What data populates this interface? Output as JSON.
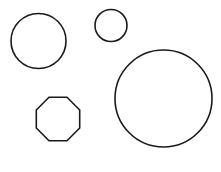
{
  "canvas": {
    "width": 221,
    "height": 172,
    "background_color": "#ffffff",
    "stroke_color": "#1a1a1a",
    "stroke_width": 1.6
  },
  "shapes": [
    {
      "name": "circle-large-left",
      "type": "circle",
      "cx": 38.5,
      "cy": 41,
      "r": 27.5,
      "fill": "none",
      "stroke": "#1a1a1a"
    },
    {
      "name": "circle-small-top",
      "type": "circle",
      "cx": 111,
      "cy": 25.5,
      "r": 16,
      "fill": "none",
      "stroke": "#1a1a1a"
    },
    {
      "name": "circle-largest-right",
      "type": "circle",
      "cx": 163.5,
      "cy": 98.5,
      "r": 48.5,
      "fill": "none",
      "stroke": "#1a1a1a"
    },
    {
      "name": "octagon-bottom-left",
      "type": "polygon",
      "sides": 8,
      "cx": 58,
      "cy": 128,
      "r": 33,
      "rotation_deg": 22.5,
      "points": "49.0,97.3 67.0,97.3 79.7,110.0 79.7,128.0 67.0,140.7 49.0,140.7 36.3,128.0 36.3,110.0",
      "fill": "none",
      "stroke": "#1a1a1a"
    }
  ],
  "chart_data": {
    "type": "scatter",
    "title": "",
    "xlabel": "",
    "ylabel": "",
    "xlim": [
      0,
      221
    ],
    "ylim": [
      0,
      172
    ],
    "grid": false,
    "legend": "none",
    "series": [
      {
        "name": "shapes",
        "points": [
          {
            "label": "circle-large-left",
            "x": 38.5,
            "y": 41,
            "size": 55
          },
          {
            "label": "circle-small-top",
            "x": 111,
            "y": 25.5,
            "size": 32
          },
          {
            "label": "circle-largest-right",
            "x": 163.5,
            "y": 98.5,
            "size": 97
          },
          {
            "label": "octagon-bottom-left",
            "x": 58,
            "y": 128,
            "size": 64
          }
        ]
      }
    ]
  }
}
